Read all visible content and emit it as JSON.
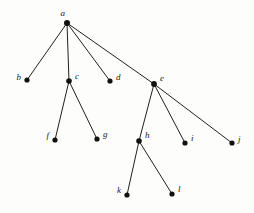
{
  "figure": {
    "type": "rooted-tree-diagram",
    "background_color": "#fdfdfc",
    "edge_color": "#231f20",
    "node_color": "#111111",
    "label_color": "#1a1a1a",
    "width": 254,
    "height": 213
  },
  "chart_data": {
    "type": "diagram",
    "title": "",
    "nodes": [
      {
        "id": "a",
        "label": "a",
        "x": 67,
        "y": 23,
        "label_x": 65,
        "label_y": 16,
        "anchor": "end",
        "parent": null,
        "depth": 0,
        "radius": 3.0
      },
      {
        "id": "b",
        "label": "b",
        "x": 27,
        "y": 80,
        "label_x": 21,
        "label_y": 80,
        "anchor": "end",
        "parent": "a",
        "depth": 1,
        "radius": 2.6
      },
      {
        "id": "c",
        "label": "c",
        "x": 69,
        "y": 81,
        "label_x": 75,
        "label_y": 79,
        "anchor": "start",
        "parent": "a",
        "depth": 1,
        "radius": 2.8
      },
      {
        "id": "d",
        "label": "d",
        "x": 110,
        "y": 81,
        "label_x": 116,
        "label_y": 80,
        "anchor": "start",
        "parent": "a",
        "depth": 1,
        "radius": 2.6
      },
      {
        "id": "e",
        "label": "e",
        "x": 154,
        "y": 84,
        "label_x": 160,
        "label_y": 81,
        "anchor": "start",
        "parent": "a",
        "depth": 1,
        "radius": 2.9
      },
      {
        "id": "f",
        "label": "f",
        "x": 55,
        "y": 140,
        "label_x": 49,
        "label_y": 138,
        "anchor": "end",
        "parent": "c",
        "depth": 2,
        "radius": 2.6
      },
      {
        "id": "g",
        "label": "g",
        "x": 97,
        "y": 139,
        "label_x": 103,
        "label_y": 137,
        "anchor": "start",
        "parent": "c",
        "depth": 2,
        "radius": 2.6
      },
      {
        "id": "h",
        "label": "h",
        "x": 139,
        "y": 141,
        "label_x": 145,
        "label_y": 138,
        "anchor": "start",
        "parent": "e",
        "depth": 2,
        "radius": 2.8
      },
      {
        "id": "i",
        "label": "i",
        "x": 185,
        "y": 143,
        "label_x": 191,
        "label_y": 141,
        "anchor": "start",
        "parent": "e",
        "depth": 2,
        "radius": 2.6
      },
      {
        "id": "j",
        "label": "j",
        "x": 232,
        "y": 143,
        "label_x": 238,
        "label_y": 142,
        "anchor": "start",
        "parent": "e",
        "depth": 2,
        "radius": 2.6
      },
      {
        "id": "k",
        "label": "k",
        "x": 127,
        "y": 195,
        "label_x": 121,
        "label_y": 193,
        "anchor": "end",
        "parent": "h",
        "depth": 3,
        "radius": 2.6
      },
      {
        "id": "l",
        "label": "l",
        "x": 172,
        "y": 194,
        "label_x": 178,
        "label_y": 192,
        "anchor": "start",
        "parent": "h",
        "depth": 3,
        "radius": 2.6
      }
    ],
    "edges": [
      {
        "from": "a",
        "to": "b"
      },
      {
        "from": "a",
        "to": "c"
      },
      {
        "from": "a",
        "to": "d"
      },
      {
        "from": "a",
        "to": "e"
      },
      {
        "from": "c",
        "to": "f"
      },
      {
        "from": "c",
        "to": "g"
      },
      {
        "from": "e",
        "to": "h"
      },
      {
        "from": "e",
        "to": "i"
      },
      {
        "from": "e",
        "to": "j"
      },
      {
        "from": "h",
        "to": "k"
      },
      {
        "from": "h",
        "to": "l"
      }
    ],
    "root": "a",
    "leaves": [
      "b",
      "d",
      "f",
      "g",
      "i",
      "j",
      "k",
      "l"
    ]
  }
}
